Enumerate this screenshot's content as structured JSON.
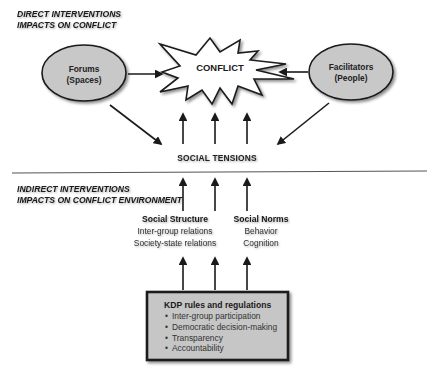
{
  "direct": {
    "title_line1": "DIRECT INTERVENTIONS",
    "title_line2": "IMPACTS ON CONFLICT"
  },
  "forums": {
    "line1": "Forums",
    "line2": "(Spaces)"
  },
  "facilitators": {
    "line1": "Facilitators",
    "line2": "(People)"
  },
  "conflict": {
    "label": "CONFLICT"
  },
  "social_tensions": {
    "label": "SOCIAL TENSIONS"
  },
  "indirect": {
    "title_line1": "INDIRECT INTERVENTIONS",
    "title_line2": "IMPACTS ON CONFLICT ENVIRONMENT"
  },
  "social_structure": {
    "heading": "Social Structure",
    "items": [
      "Inter-group relations",
      "Society-state relations"
    ]
  },
  "social_norms": {
    "heading": "Social Norms",
    "items": [
      "Behavior",
      "Cognition"
    ]
  },
  "kdp": {
    "title": "KDP rules and regulations",
    "items": [
      "Inter-group participation",
      "Democratic decision-making",
      "Transparency",
      "Accountability"
    ],
    "bullet": "•"
  },
  "colors": {
    "ellipse_fill": "#c8c8c8",
    "box_fill": "#c6c6c6",
    "stroke": "#1a1a1a",
    "divider": "#555555"
  }
}
